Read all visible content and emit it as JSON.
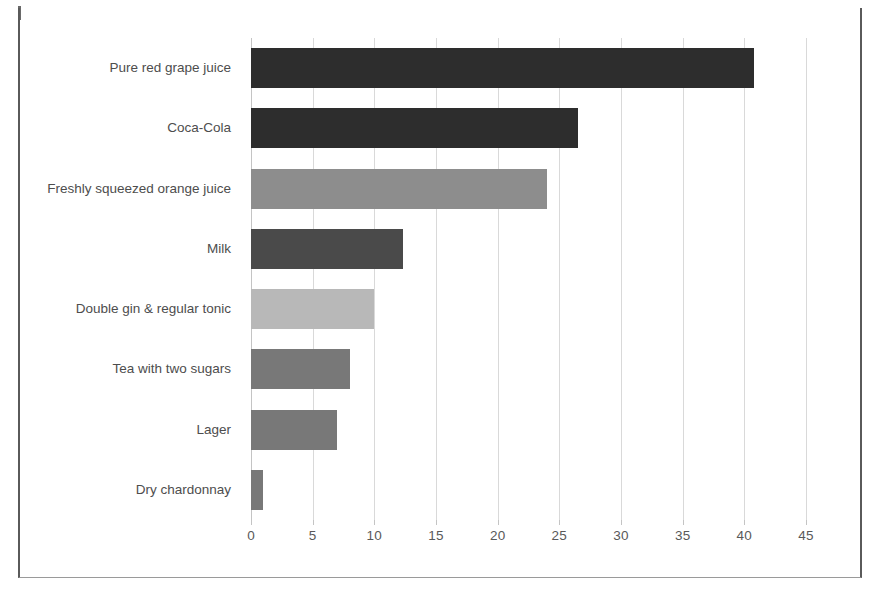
{
  "page": {
    "background_color": "#ffffff",
    "border_color": "#5a5a5a"
  },
  "chart_data": {
    "type": "bar",
    "orientation": "horizontal",
    "title": "",
    "subtitle": "",
    "xlabel": "",
    "ylabel": "",
    "xlim": [
      0,
      45
    ],
    "ylim": null,
    "grid": "vertical",
    "legend": "none",
    "tick_labels": [
      "0",
      "5",
      "10",
      "15",
      "20",
      "25",
      "30",
      "35",
      "40",
      "45"
    ],
    "tick_values": [
      0,
      5,
      10,
      15,
      20,
      25,
      30,
      35,
      40,
      45
    ],
    "categories": [
      "Pure red grape juice",
      "Coca-Cola",
      "Freshly squeezed orange juice",
      "Milk",
      "Double gin & regular tonic",
      "Tea with two sugars",
      "Lager",
      "Dry chardonnay"
    ],
    "values": [
      40.8,
      26.5,
      24.0,
      12.3,
      10.0,
      8.0,
      7.0,
      1.0
    ],
    "bar_colors": [
      "#2d2d2d",
      "#2d2d2d",
      "#8d8d8d",
      "#4a4a4a",
      "#b8b8b8",
      "#787878",
      "#787878",
      "#787878"
    ],
    "gridline_color": "#d9d9d9",
    "tick_label_color": "#595959",
    "category_label_color": "#4d4d4d"
  }
}
